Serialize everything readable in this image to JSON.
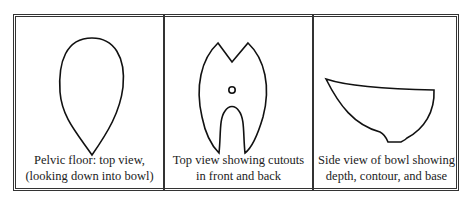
{
  "figure": {
    "panels": [
      {
        "id": "pelvic-floor-top",
        "caption_line1": "Pelvic floor: top view,",
        "caption_line2": "(looking down into bowl)"
      },
      {
        "id": "cutouts-top",
        "caption_line1": "Top view showing cutouts",
        "caption_line2": "in front and back"
      },
      {
        "id": "bowl-side",
        "caption_line1": "Side view of bowl showing",
        "caption_line2": "depth, contour, and base"
      }
    ]
  }
}
